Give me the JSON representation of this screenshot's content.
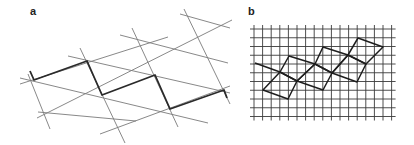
{
  "panels": {
    "a": {
      "label": "a",
      "description": "Triangular lattice with bold zigzag path",
      "thin_lines": [
        [
          [
            28,
            74
          ],
          [
            50,
            129
          ]
        ],
        [
          [
            80,
            48
          ],
          [
            125,
            143
          ]
        ],
        [
          [
            132,
            28
          ],
          [
            178,
            127
          ]
        ],
        [
          [
            184,
            9
          ],
          [
            230,
            104
          ]
        ],
        [
          [
            20,
            78
          ],
          [
            208,
            123
          ]
        ],
        [
          [
            68,
            56
          ],
          [
            230,
            93
          ]
        ],
        [
          [
            120,
            35
          ],
          [
            228,
            63
          ]
        ],
        [
          [
            180,
            14
          ],
          [
            230,
            28
          ]
        ],
        [
          [
            37,
            118
          ],
          [
            232,
            20
          ]
        ],
        [
          [
            100,
            134
          ],
          [
            230,
            86
          ]
        ],
        [
          [
            20,
            84
          ],
          [
            168,
            37
          ]
        ],
        [
          [
            38,
            112
          ],
          [
            136,
            121
          ]
        ]
      ],
      "bold_path": [
        [
          30,
          71
        ],
        [
          34,
          80
        ],
        [
          87,
          61
        ],
        [
          102,
          95
        ],
        [
          155,
          75
        ],
        [
          170,
          109
        ],
        [
          224,
          90
        ],
        [
          227,
          98
        ]
      ],
      "colors": {
        "thin": "#7a7a7a",
        "bold": "#2a2a2a"
      }
    },
    "b": {
      "label": "b",
      "description": "Square grid with overlaid chain of tilted squares",
      "grid": {
        "x0": 254,
        "y0": 29,
        "dx": 8.6,
        "dy": 8.75,
        "cols": 17,
        "rows": 11,
        "overhang": 4
      },
      "squares": [
        [
          [
            263,
            90
          ],
          [
            280,
            72
          ],
          [
            297,
            81
          ],
          [
            288,
            99
          ]
        ],
        [
          [
            280,
            72
          ],
          [
            289,
            56
          ],
          [
            315,
            64
          ],
          [
            297,
            81
          ]
        ],
        [
          [
            297,
            81
          ],
          [
            315,
            64
          ],
          [
            332,
            73
          ],
          [
            323,
            90
          ]
        ],
        [
          [
            315,
            64
          ],
          [
            323,
            47
          ],
          [
            348,
            55
          ],
          [
            332,
            73
          ]
        ],
        [
          [
            332,
            73
          ],
          [
            348,
            55
          ],
          [
            366,
            64
          ],
          [
            357,
            82
          ]
        ],
        [
          [
            348,
            55
          ],
          [
            358,
            38
          ],
          [
            383,
            47
          ],
          [
            366,
            64
          ]
        ]
      ],
      "tail_line": [
        [
          255,
          63
        ],
        [
          280,
          72
        ]
      ],
      "colors": {
        "grid": "#3a3a3a",
        "squares": "#1e1e1e"
      }
    }
  }
}
